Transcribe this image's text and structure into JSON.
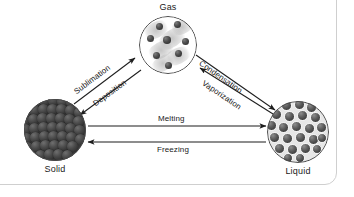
{
  "figure": {
    "type": "phase-change-diagram",
    "background_color": "#ffffff",
    "frame_color": "#cfcfcf"
  },
  "nodes": [
    {
      "id": "gas",
      "label": "Gas",
      "state": "gaseous",
      "texture": "sparse dark particles with motion-blur streaks on white",
      "particle_color": "#3a3a3a",
      "fill_color": "#ffffff"
    },
    {
      "id": "solid",
      "label": "Solid",
      "state": "solid",
      "texture": "densely packed ordered dark spheres",
      "particle_color": "#4a4a4a",
      "fill_color": "#3a3a3a"
    },
    {
      "id": "liquid",
      "label": "Liquid",
      "state": "liquid",
      "texture": "loosely packed spheres with light gaps",
      "particle_color": "#5a5a5a",
      "fill_color": "#e7e7e7"
    }
  ],
  "transitions": [
    {
      "id": "sublimation",
      "label": "Sublimation",
      "from": "solid",
      "to": "gas"
    },
    {
      "id": "deposition",
      "label": "Deposition",
      "from": "gas",
      "to": "solid"
    },
    {
      "id": "condensation",
      "label": "Condensation",
      "from": "gas",
      "to": "liquid"
    },
    {
      "id": "vaporization",
      "label": "Vaporization",
      "from": "liquid",
      "to": "gas"
    },
    {
      "id": "melting",
      "label": "Melting",
      "from": "solid",
      "to": "liquid"
    },
    {
      "id": "freezing",
      "label": "Freezing",
      "from": "liquid",
      "to": "solid"
    }
  ]
}
